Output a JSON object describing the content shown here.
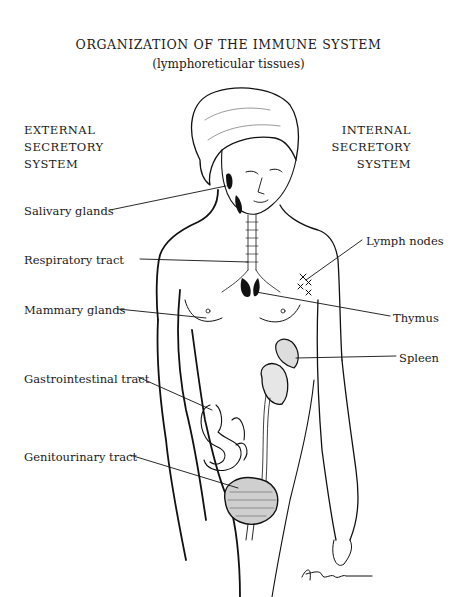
{
  "title": "ORGANIZATION OF THE IMMUNE SYSTEM",
  "subtitle": "(lymphoreticular tissues)",
  "left_heading": [
    "EXTERNAL",
    "SECRETORY",
    "SYSTEM"
  ],
  "right_heading": [
    "INTERNAL",
    "SECRETORY",
    "SYSTEM"
  ],
  "labels_left": [
    {
      "text": "Salivary glands",
      "x": 24,
      "y": 204
    },
    {
      "text": "Respiratory tract",
      "x": 24,
      "y": 253
    },
    {
      "text": "Mammary glands",
      "x": 24,
      "y": 303
    },
    {
      "text": "Gastrointestinal tract",
      "x": 24,
      "y": 372
    },
    {
      "text": "Genitourinary tract",
      "x": 24,
      "y": 450
    }
  ],
  "labels_right": [
    {
      "text": "Lymph nodes",
      "x": 366,
      "y": 234
    },
    {
      "text": "Thymus",
      "x": 393,
      "y": 311
    },
    {
      "text": "Spleen",
      "x": 399,
      "y": 351
    }
  ],
  "signature": "Hurd"
}
